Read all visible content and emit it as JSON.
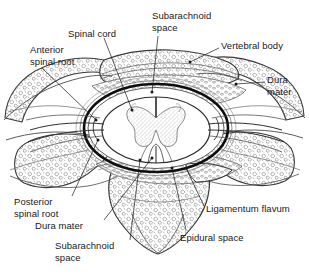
{
  "figure": {
    "background_color": "#ffffff",
    "ink_color": "#1a1a1a",
    "width": 309,
    "height": 274
  },
  "labels": [
    {
      "id": "subarachnoid-space-top",
      "text": "Subarachnoid\nspace",
      "x": 152,
      "y": 10,
      "align": "left",
      "leader": "from text down to dura/arachnoid at top midline of cord"
    },
    {
      "id": "spinal-cord",
      "text": "Spinal cord",
      "x": 68,
      "y": 28,
      "align": "left",
      "leader": "from text diagonally down-right into cord white matter"
    },
    {
      "id": "vertebral-body",
      "text": "Vertebral body",
      "x": 221,
      "y": 40,
      "align": "left",
      "leader": "from text left-down into cancellous bone of body"
    },
    {
      "id": "anterior-spinal-root",
      "text": "Anterior\nspinal root",
      "x": 30,
      "y": 44,
      "align": "left",
      "leader": "from text down-right to anterior root near cord"
    },
    {
      "id": "dura-mater-right",
      "text": "Dura\nmater",
      "x": 267,
      "y": 74,
      "align": "left",
      "leader": "from text left into dural sac margin"
    },
    {
      "id": "posterior-spinal-root",
      "text": "Posterior\nspinal root",
      "x": 14,
      "y": 196,
      "align": "left",
      "leader": "from text up-right to posterior root"
    },
    {
      "id": "ligamentum-flavum",
      "text": "Ligamentum flavum",
      "x": 206,
      "y": 203,
      "align": "left",
      "leader": "from text up-left to ligamentum flavum"
    },
    {
      "id": "dura-mater-bottom",
      "text": "Dura mater",
      "x": 35,
      "y": 220,
      "align": "left",
      "leader": "from text up-right to posterior dura"
    },
    {
      "id": "epidural-space",
      "text": "Epidural space",
      "x": 180,
      "y": 232,
      "align": "left",
      "leader": "from text up-left into epidural fat space"
    },
    {
      "id": "subarachnoid-space-bottom",
      "text": "Subarachnoid\nspace",
      "x": 55,
      "y": 240,
      "align": "left",
      "leader": "from text up-right to posterior subarachnoid space"
    }
  ],
  "structures": [
    {
      "id": "spinal-cord",
      "name": "Spinal cord"
    },
    {
      "id": "gray-matter",
      "name": "Gray matter (butterfly)"
    },
    {
      "id": "white-matter",
      "name": "White matter"
    },
    {
      "id": "anterior-median-fissure",
      "name": "Anterior median fissure"
    },
    {
      "id": "posterior-median-septum",
      "name": "Posterior median septum"
    },
    {
      "id": "dura-mater",
      "name": "Dura mater"
    },
    {
      "id": "arachnoid-mater",
      "name": "Arachnoid mater"
    },
    {
      "id": "subarachnoid-space",
      "name": "Subarachnoid space"
    },
    {
      "id": "epidural-space",
      "name": "Epidural space"
    },
    {
      "id": "vertebral-body",
      "name": "Vertebral body"
    },
    {
      "id": "transverse-process-left",
      "name": "Left transverse process"
    },
    {
      "id": "transverse-process-right",
      "name": "Right transverse process"
    },
    {
      "id": "vertebral-arch",
      "name": "Vertebral arch / lamina"
    },
    {
      "id": "spinous-process",
      "name": "Spinous process"
    },
    {
      "id": "ligamentum-flavum",
      "name": "Ligamentum flavum"
    },
    {
      "id": "anterior-spinal-root",
      "name": "Anterior spinal root"
    },
    {
      "id": "posterior-spinal-root",
      "name": "Posterior spinal root"
    }
  ]
}
